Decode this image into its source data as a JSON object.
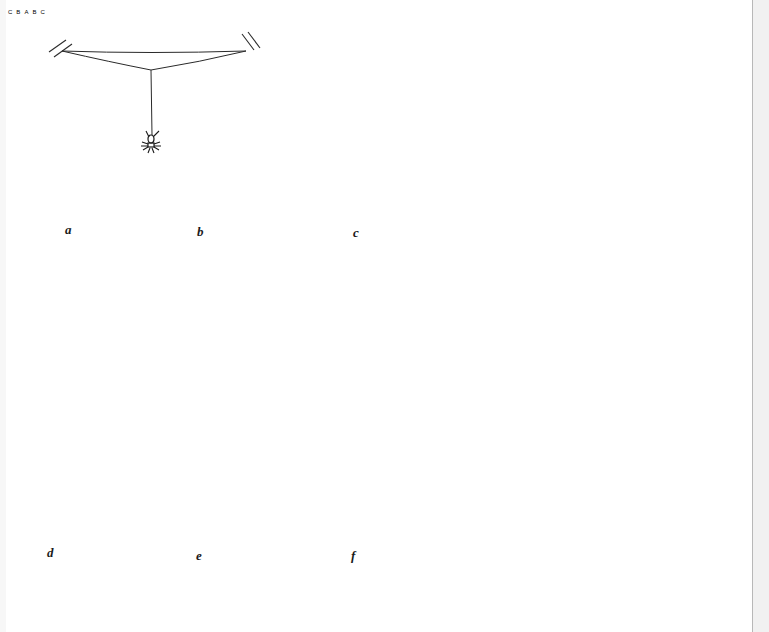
{
  "figure": {
    "panels": [
      {
        "id": "a",
        "label": "a",
        "caption_pos": [
          65,
          230
        ],
        "content": "bridge thread between two anchors, spider hanging from a drop line"
      },
      {
        "id": "b",
        "label": "b",
        "caption_pos": [
          197,
          232
        ],
        "content": "Y-shaped frame anchored to the ground"
      },
      {
        "id": "c",
        "label": "c",
        "caption_pos": [
          353,
          233
        ],
        "content": "frame with threads A, B, C",
        "thread_labels": [
          "A",
          "B",
          "C"
        ]
      },
      {
        "id": "d",
        "label": "d",
        "caption_pos": [
          47,
          553
        ],
        "content": "spider laying thread C along arrows, with threads A and B",
        "thread_labels": [
          "A",
          "B",
          "C"
        ]
      },
      {
        "id": "e",
        "label": "e",
        "caption_pos": [
          196,
          556
        ],
        "content": "five-sided frame with radii"
      },
      {
        "id": "f",
        "label": "f",
        "caption_pos": [
          351,
          556
        ],
        "content": "completed orb web with spiral"
      }
    ],
    "labels": {
      "a": "a",
      "b": "b",
      "c": "c",
      "d": "d",
      "e": "e",
      "f": "f",
      "A": "A",
      "B": "B",
      "C": "C"
    },
    "colors": {
      "ink": "#2a2a2a",
      "paper": "#ffffff",
      "gutter": "#f1f1f1"
    }
  }
}
